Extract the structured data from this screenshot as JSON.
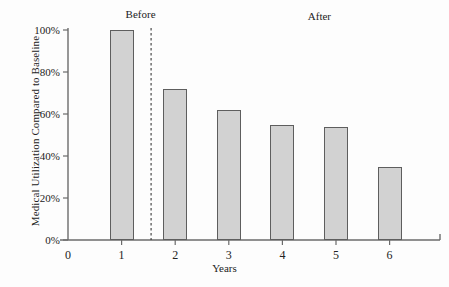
{
  "chart_data": {
    "type": "bar",
    "title": "",
    "xlabel": "Years",
    "ylabel": "Medical Utilization Compared to Baseline",
    "categories": [
      "1",
      "2",
      "3",
      "4",
      "5",
      "6"
    ],
    "values": [
      100,
      72,
      62,
      55,
      54,
      35
    ],
    "value_unit": "%",
    "ylim": [
      0,
      100
    ],
    "xlim": [
      0,
      7
    ],
    "ytick_labels": [
      "0%",
      "20%",
      "40%",
      "60%",
      "80%",
      "100%"
    ],
    "ytick_values": [
      0,
      20,
      40,
      60,
      80,
      100
    ],
    "xtick_labels": [
      "0",
      "1",
      "2",
      "3",
      "4",
      "5",
      "6"
    ],
    "xtick_values": [
      0,
      1,
      2,
      3,
      4,
      5,
      6
    ],
    "grid": false,
    "legend": "none",
    "bar_fill_color": "#d2d2d2",
    "bar_edge_color": "#5e5e5e",
    "axis_color": "#6b6b6b",
    "annotations": [
      {
        "text": "Before",
        "x_value": 1.0
      },
      {
        "text": "After",
        "x_value": 4.4
      }
    ],
    "divider": {
      "type": "dashed-vertical-line",
      "x_value": 1.55,
      "color": "#3a3a3a"
    }
  }
}
